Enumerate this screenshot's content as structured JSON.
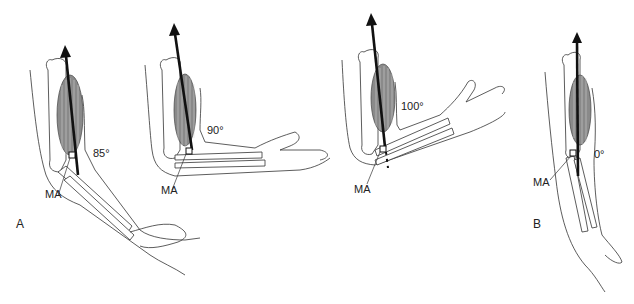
{
  "figure": {
    "panel_labels": {
      "a": "A",
      "b": "B"
    },
    "arms": [
      {
        "id": "arm-85",
        "angle_label": "85°",
        "moment_arm_label": "MA"
      },
      {
        "id": "arm-90",
        "angle_label": "90°",
        "moment_arm_label": "MA"
      },
      {
        "id": "arm-100",
        "angle_label": "100°",
        "moment_arm_label": "MA"
      },
      {
        "id": "arm-0",
        "angle_label": "0°",
        "moment_arm_label": "MA"
      }
    ],
    "colors": {
      "muscle": "#8a8a8a",
      "force_vector": "#111111",
      "outline": "#333333"
    }
  }
}
